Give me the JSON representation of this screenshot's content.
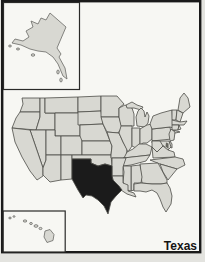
{
  "map": {
    "label": "Texas",
    "highlighted_state": "Texas",
    "insets": [
      "Alaska",
      "Hawaii"
    ],
    "colors": {
      "page_background": "#e3e3df",
      "card_background": "#f7f7f3",
      "frame_border": "#1a1a1a",
      "state_fill": "#d8d8d2",
      "state_border": "#4c4c48",
      "inset_outline": "#6a6a66",
      "highlight_fill": "#1b1b1b",
      "bay_mark": "#66665f",
      "label_color": "#141414"
    }
  }
}
